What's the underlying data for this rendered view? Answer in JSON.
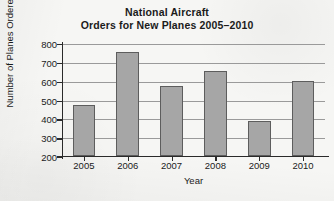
{
  "chart_data": {
    "type": "bar",
    "title": "National Aircraft Orders for New Planes 2005–2010",
    "title_lines": [
      "National Aircraft",
      "Orders for New Planes 2005–2010"
    ],
    "categories": [
      "2005",
      "2006",
      "2007",
      "2008",
      "2009",
      "2010"
    ],
    "values": [
      470,
      750,
      570,
      650,
      385,
      600
    ],
    "xlabel": "Year",
    "ylabel": "Number of Planes Ordered",
    "ylim": [
      200,
      800
    ],
    "yticks": [
      200,
      300,
      400,
      500,
      600,
      700,
      800
    ],
    "ytick_labels": [
      "200",
      "300",
      "400",
      "500",
      "600",
      "700",
      "800"
    ],
    "grid": true,
    "legend": false,
    "series": [
      {
        "name": "Planes ordered",
        "values": [
          470,
          750,
          570,
          650,
          385,
          600
        ]
      }
    ],
    "colors": {
      "bar_fill": "#a6a6a6",
      "bar_edge": "#5d5d5d",
      "axis": "#2a2a2a",
      "grid": "#9a9a9a",
      "background": "#f6f6f4",
      "text": "#1b1b1b"
    }
  }
}
